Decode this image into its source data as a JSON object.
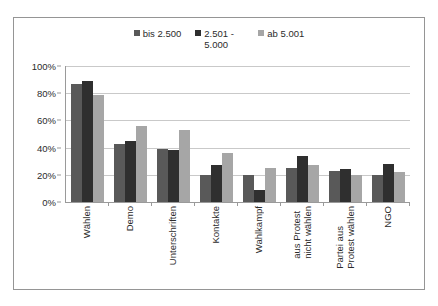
{
  "chart_data": {
    "type": "bar",
    "title": "",
    "subtitle": "",
    "xlabel": "",
    "ylabel": "",
    "ylim": [
      0,
      100
    ],
    "y_ticks": [
      "0%",
      "20%",
      "40%",
      "60%",
      "80%",
      "100%"
    ],
    "y_tick_values": [
      0,
      20,
      40,
      60,
      80,
      100
    ],
    "grid": true,
    "legend_position": "top",
    "categories": [
      "Wählen",
      "Demo",
      "Unterschriften",
      "Kontakte",
      "Wahlkampf",
      "aus Protest\nnicht wählen",
      "Partei aus\nProtest wählen",
      "NGO"
    ],
    "series": [
      {
        "name": "bis 2.500",
        "color": "#595959",
        "values": [
          87,
          43,
          39,
          20,
          20,
          25,
          23,
          20
        ]
      },
      {
        "name": "2.501 -\n5.000",
        "color": "#2f2f2f",
        "values": [
          89,
          45,
          38,
          27,
          9,
          34,
          24,
          28
        ]
      },
      {
        "name": "ab 5.001",
        "color": "#a6a6a6",
        "values": [
          79,
          56,
          53,
          36,
          25,
          27,
          20,
          22
        ]
      }
    ]
  },
  "legend": {
    "items": [
      {
        "label": "bis 2.500",
        "color": "#595959"
      },
      {
        "label": "2.501 -\n5.000",
        "color": "#2f2f2f"
      },
      {
        "label": "ab 5.001",
        "color": "#a6a6a6"
      }
    ]
  },
  "colors": {
    "frame_border": "#959595",
    "axis": "#9a9a9a",
    "gridline": "#c9c9c9",
    "text": "#2b2b2b",
    "background": "#ffffff"
  }
}
